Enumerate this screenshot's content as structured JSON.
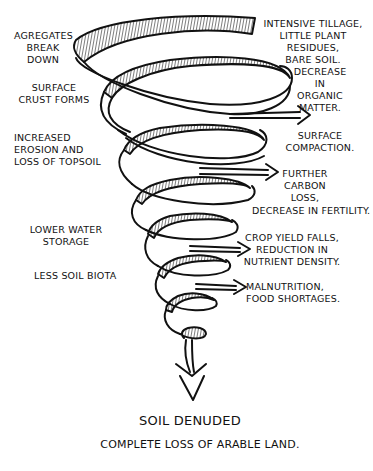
{
  "diagram": {
    "type": "downward-spiral",
    "stroke_color": "#111111",
    "background_color": "#ffffff",
    "left_labels": [
      {
        "id": "agregates",
        "text": "Agregates\nBreak\nDown"
      },
      {
        "id": "surface-crust",
        "text": "Surface\nCrust Forms"
      },
      {
        "id": "erosion",
        "text": "Increased\nErosion and\nLoss of Topsoil"
      },
      {
        "id": "water",
        "text": "Lower Water\nStorage"
      },
      {
        "id": "biota",
        "text": "Less Soil Biota"
      }
    ],
    "right_labels": [
      {
        "id": "tillage",
        "text": "Intensive Tillage,\nLittle Plant Residues,\nBare Soil."
      },
      {
        "id": "organic",
        "text": "Decrease\nin\nOrganic\nMatter."
      },
      {
        "id": "compaction",
        "text": "Surface\nCompaction."
      },
      {
        "id": "carbon",
        "text": "Further\nCarbon Loss,"
      },
      {
        "id": "fertility",
        "text": "Decrease in Fertility."
      },
      {
        "id": "crop",
        "text": "Crop Yield Falls,\nReduction in\nNutrient Density."
      },
      {
        "id": "malnutrition",
        "text": "Malnutrition,\nFood Shortages."
      }
    ],
    "outcome": {
      "title": "Soil Denuded",
      "subtitle": "Complete Loss of Arable Land."
    }
  }
}
